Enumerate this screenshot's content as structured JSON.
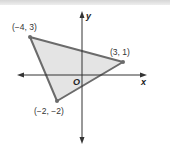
{
  "diagram": {
    "type": "coordinate-plane-triangle",
    "axes": {
      "x_label": "x",
      "y_label": "y",
      "origin_label": "O"
    },
    "vertices": [
      {
        "label": "(−4, 3)",
        "x": -4,
        "y": 3
      },
      {
        "label": "(3, 1)",
        "x": 3,
        "y": 1
      },
      {
        "label": "(−2, −2)",
        "x": -2,
        "y": -2
      }
    ],
    "colors": {
      "fill": "#e4e4e4",
      "stroke": "#6b6b6b",
      "axis": "#333333"
    }
  }
}
